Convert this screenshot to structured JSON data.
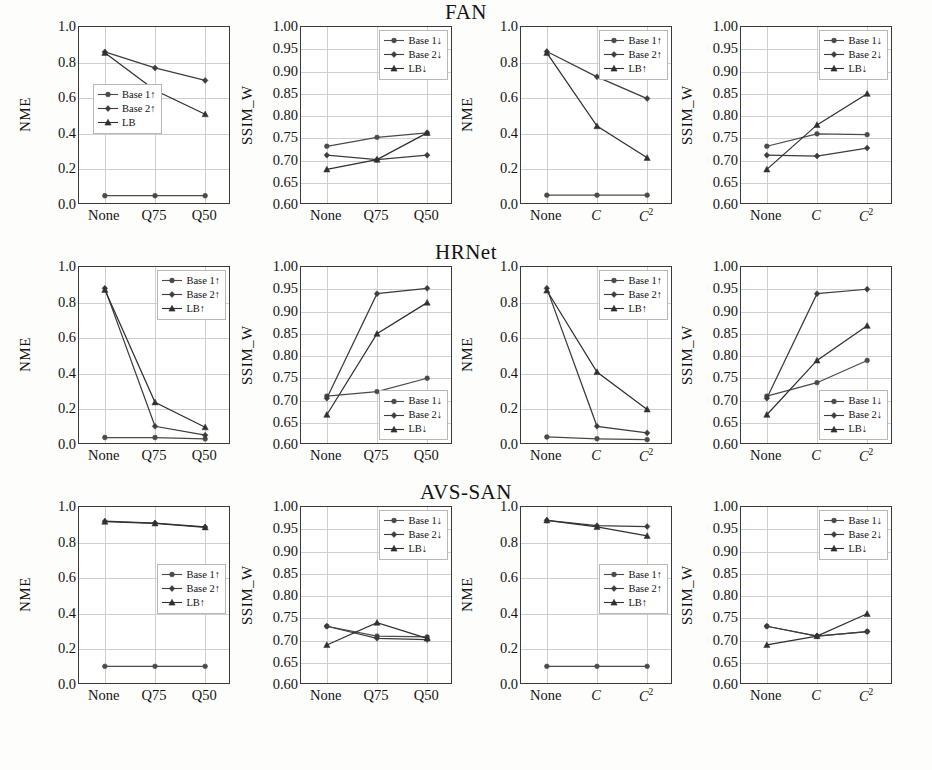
{
  "figure": {
    "width": 932,
    "height": 770,
    "series_colors": {
      "base1": "#4a4a4a",
      "base2": "#3c3c3c",
      "lb": "#303030"
    },
    "grid": true
  },
  "rows": [
    {
      "title": "FAN",
      "panels": [
        {
          "ylabel": "NME",
          "yticks": [
            "1.0",
            "0.8",
            "0.6",
            "0.4",
            "0.2",
            "0.0"
          ],
          "ylim": [
            0.0,
            1.0
          ],
          "xticks": [
            "None",
            "Q75",
            "Q50"
          ],
          "legend_pos": "midleft",
          "legend": [
            "Base 1↑",
            "Base 2↑",
            "LB"
          ],
          "series": [
            {
              "name": "Base 1↑",
              "values": [
                0.052,
                0.052,
                0.052
              ]
            },
            {
              "name": "Base 2↑",
              "values": [
                0.86,
                0.77,
                0.7
              ]
            },
            {
              "name": "LB",
              "values": [
                0.855,
                0.645,
                0.51
              ]
            }
          ]
        },
        {
          "ylabel": "SSIM_W",
          "yticks": [
            "1.00",
            "0.95",
            "0.90",
            "0.85",
            "0.80",
            "0.75",
            "0.70",
            "0.65",
            "0.60"
          ],
          "ylim": [
            0.6,
            1.0
          ],
          "xticks": [
            "None",
            "Q75",
            "Q50"
          ],
          "legend_pos": "topright",
          "legend": [
            "Base 1↓",
            "Base 2↓",
            "LB↓"
          ],
          "series": [
            {
              "name": "Base 1↓",
              "values": [
                0.732,
                0.752,
                0.762
              ]
            },
            {
              "name": "Base 2↓",
              "values": [
                0.712,
                0.702,
                0.712
              ]
            },
            {
              "name": "LB↓",
              "values": [
                0.68,
                0.702,
                0.762
              ]
            }
          ]
        },
        {
          "ylabel": "NME",
          "yticks": [
            "1.0",
            "0.8",
            "0.6",
            "0.4",
            "0.2",
            "0.0"
          ],
          "ylim": [
            0.0,
            1.0
          ],
          "xticks": [
            "None",
            "C",
            "C2"
          ],
          "legend_pos": "topright",
          "legend": [
            "Base 1↑",
            "Base 2↑",
            "LB↑"
          ],
          "series": [
            {
              "name": "Base 1↑",
              "values": [
                0.055,
                0.055,
                0.055
              ]
            },
            {
              "name": "Base 2↑",
              "values": [
                0.862,
                0.72,
                0.598
              ]
            },
            {
              "name": "LB↑",
              "values": [
                0.855,
                0.443,
                0.265
              ]
            }
          ]
        },
        {
          "ylabel": "SSIM_W",
          "yticks": [
            "1.00",
            "0.95",
            "0.90",
            "0.85",
            "0.80",
            "0.75",
            "0.70",
            "0.65",
            "0.60"
          ],
          "ylim": [
            0.6,
            1.0
          ],
          "xticks": [
            "None",
            "C",
            "C2"
          ],
          "legend_pos": "topright",
          "legend": [
            "Base 1↓",
            "Base 2↓",
            "LB↓"
          ],
          "series": [
            {
              "name": "Base 1↓",
              "values": [
                0.732,
                0.76,
                0.758
              ]
            },
            {
              "name": "Base 2↓",
              "values": [
                0.712,
                0.71,
                0.728
              ]
            },
            {
              "name": "LB↓",
              "values": [
                0.68,
                0.78,
                0.85
              ]
            }
          ]
        }
      ]
    },
    {
      "title": "HRNet",
      "panels": [
        {
          "ylabel": "NME",
          "yticks": [
            "1.0",
            "0.8",
            "0.6",
            "0.4",
            "0.2",
            "0.0"
          ],
          "ylim": [
            0.0,
            1.0
          ],
          "xticks": [
            "None",
            "Q75",
            "Q50"
          ],
          "legend_pos": "topright",
          "legend": [
            "Base 1↑",
            "Base 2↑",
            "LB↑"
          ],
          "series": [
            {
              "name": "Base 1↑",
              "values": [
                0.042,
                0.042,
                0.034
              ]
            },
            {
              "name": "Base 2↑",
              "values": [
                0.88,
                0.105,
                0.055
              ]
            },
            {
              "name": "LB↑",
              "values": [
                0.872,
                0.24,
                0.1
              ]
            }
          ]
        },
        {
          "ylabel": "SSIM_W",
          "yticks": [
            "1.00",
            "0.95",
            "0.90",
            "0.85",
            "0.80",
            "0.75",
            "0.70",
            "0.65",
            "0.60"
          ],
          "ylim": [
            0.6,
            1.0
          ],
          "xticks": [
            "None",
            "Q75",
            "Q50"
          ],
          "legend_pos": "bottomright",
          "legend": [
            "Base 1↓",
            "Base 2↓",
            "LB↓"
          ],
          "series": [
            {
              "name": "Base 1↓",
              "values": [
                0.71,
                0.72,
                0.75
              ]
            },
            {
              "name": "Base 2↓",
              "values": [
                0.705,
                0.94,
                0.952
              ]
            },
            {
              "name": "LB↓",
              "values": [
                0.668,
                0.85,
                0.92
              ]
            }
          ]
        },
        {
          "ylabel": "NME",
          "yticks": [
            "1.0",
            "0.8",
            "0.6",
            "0.4",
            "0.2",
            "0.0"
          ],
          "ylim": [
            0.0,
            1.0
          ],
          "xticks": [
            "None",
            "C",
            "C2"
          ],
          "legend_pos": "topright",
          "legend": [
            "Base 1↑",
            "Base 2↑",
            "LB↑"
          ],
          "series": [
            {
              "name": "Base 1↑",
              "values": [
                0.045,
                0.035,
                0.03
              ]
            },
            {
              "name": "Base 2↑",
              "values": [
                0.88,
                0.105,
                0.068
              ]
            },
            {
              "name": "LB↑",
              "values": [
                0.868,
                0.41,
                0.2
              ]
            }
          ]
        },
        {
          "ylabel": "SSIM_W",
          "yticks": [
            "1.00",
            "0.95",
            "0.90",
            "0.85",
            "0.80",
            "0.75",
            "0.70",
            "0.65",
            "0.60"
          ],
          "ylim": [
            0.6,
            1.0
          ],
          "xticks": [
            "None",
            "C",
            "C2"
          ],
          "legend_pos": "bottomright",
          "legend": [
            "Base 1↓",
            "Base 2↓",
            "LB↓"
          ],
          "series": [
            {
              "name": "Base 1↓",
              "values": [
                0.71,
                0.74,
                0.79
              ]
            },
            {
              "name": "Base 2↓",
              "values": [
                0.705,
                0.94,
                0.95
              ]
            },
            {
              "name": "LB↓",
              "values": [
                0.668,
                0.79,
                0.868
              ]
            }
          ]
        }
      ]
    },
    {
      "title": "AVS-SAN",
      "panels": [
        {
          "ylabel": "NME",
          "yticks": [
            "1.0",
            "0.8",
            "0.6",
            "0.4",
            "0.2",
            "0.0"
          ],
          "ylim": [
            0.0,
            1.0
          ],
          "xticks": [
            "None",
            "Q75",
            "Q50"
          ],
          "legend_pos": "midright",
          "legend": [
            "Base 1↑",
            "Base 2↑",
            "LB↑"
          ],
          "series": [
            {
              "name": "Base 1↑",
              "values": [
                0.105,
                0.105,
                0.105
              ]
            },
            {
              "name": "Base 2↑",
              "values": [
                0.92,
                0.91,
                0.888
              ]
            },
            {
              "name": "LB↑",
              "values": [
                0.918,
                0.908,
                0.886
              ]
            }
          ]
        },
        {
          "ylabel": "SSIM_W",
          "yticks": [
            "1.00",
            "0.95",
            "0.90",
            "0.85",
            "0.80",
            "0.75",
            "0.70",
            "0.65",
            "0.60"
          ],
          "ylim": [
            0.6,
            1.0
          ],
          "xticks": [
            "None",
            "Q75",
            "Q50"
          ],
          "legend_pos": "topright",
          "legend": [
            "Base 1↓",
            "Base 2↓",
            "LB↓"
          ],
          "series": [
            {
              "name": "Base 1↓",
              "values": [
                0.732,
                0.71,
                0.708
              ]
            },
            {
              "name": "Base 2↓",
              "values": [
                0.732,
                0.705,
                0.702
              ]
            },
            {
              "name": "LB↓",
              "values": [
                0.69,
                0.74,
                0.705
              ]
            }
          ]
        },
        {
          "ylabel": "NME",
          "yticks": [
            "1.0",
            "0.8",
            "0.6",
            "0.4",
            "0.2",
            "0.0"
          ],
          "ylim": [
            0.0,
            1.0
          ],
          "xticks": [
            "None",
            "C",
            "C2"
          ],
          "legend_pos": "midright",
          "legend": [
            "Base 1↑",
            "Base 2↑",
            "LB↑"
          ],
          "series": [
            {
              "name": "Base 1↑",
              "values": [
                0.105,
                0.105,
                0.105
              ]
            },
            {
              "name": "Base 2↑",
              "values": [
                0.925,
                0.895,
                0.89
              ]
            },
            {
              "name": "LB↑",
              "values": [
                0.925,
                0.888,
                0.838
              ]
            }
          ]
        },
        {
          "ylabel": "SSIM_W",
          "yticks": [
            "1.00",
            "0.95",
            "0.90",
            "0.85",
            "0.80",
            "0.75",
            "0.70",
            "0.65",
            "0.60"
          ],
          "ylim": [
            0.6,
            1.0
          ],
          "xticks": [
            "None",
            "C",
            "C2"
          ],
          "legend_pos": "topright",
          "legend": [
            "Base 1↓",
            "Base 2↓",
            "LB↓"
          ],
          "series": [
            {
              "name": "Base 1↓",
              "values": [
                0.732,
                0.71,
                0.72
              ]
            },
            {
              "name": "Base 2↓",
              "values": [
                0.732,
                0.71,
                0.72
              ]
            },
            {
              "name": "LB↓",
              "values": [
                0.69,
                0.71,
                0.76
              ]
            }
          ]
        }
      ]
    }
  ],
  "chart_data": {
    "type": "line",
    "panel_grid": "3 rows (FAN, HRNet, AVS-SAN) x 4 columns (NME vs Q, SSIM_W vs Q, NME vs C, SSIM_W vs C)",
    "x_categories_quality": [
      "None",
      "Q75",
      "Q50"
    ],
    "x_categories_compression": [
      "None",
      "C",
      "C^2"
    ],
    "series_names": [
      "Base 1",
      "Base 2",
      "LB"
    ],
    "ylabels": [
      "NME",
      "SSIM_W"
    ],
    "ylim_nme": [
      0.0,
      1.0
    ],
    "ylim_ssim": [
      0.6,
      1.0
    ],
    "legend_position": "varies per panel",
    "grid": true
  }
}
